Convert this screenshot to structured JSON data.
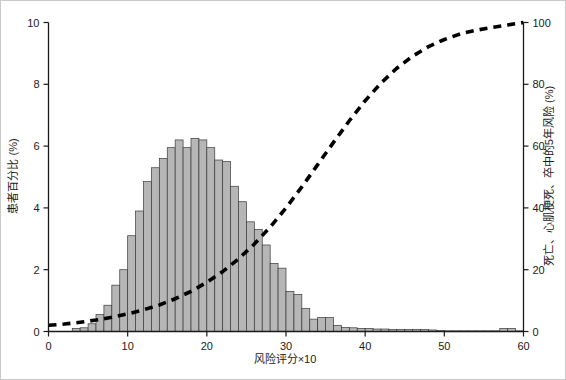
{
  "chart_data": {
    "type": "bar",
    "title": "",
    "subtitle": "",
    "xlabel": "风险评分×10",
    "ylabel": "患者百分比 (%)",
    "y2label": "死亡、心肌梗死、卒中的5年风险 (%)",
    "xlim": [
      0,
      60
    ],
    "ylim": [
      0,
      10
    ],
    "y2lim": [
      0,
      100
    ],
    "grid": false,
    "legend": false,
    "legend_position": "none",
    "xticks": [
      0,
      10,
      20,
      30,
      40,
      50,
      60
    ],
    "xticklabels": [
      "0",
      "10",
      "20",
      "30",
      "40",
      "50",
      "60"
    ],
    "yticks": [
      0,
      2,
      4,
      6,
      8,
      10
    ],
    "yticklabels": [
      "0",
      "2",
      "4",
      "6",
      "8",
      "10"
    ],
    "y2ticks": [
      0,
      20,
      40,
      60,
      80,
      100
    ],
    "y2ticklabels": [
      "0",
      "20",
      "40",
      "60",
      "80",
      "100"
    ],
    "bar_color": "#b6b6b6",
    "bar_edge_color": "#3a3a3a",
    "curve_color": "#000000",
    "curve_style": "dashed",
    "bar_width": 1,
    "series": [
      {
        "name": "患者百分比 (%)",
        "type": "bar",
        "axis": "left",
        "categories": [
          0,
          1,
          2,
          3,
          4,
          5,
          6,
          7,
          8,
          9,
          10,
          11,
          12,
          13,
          14,
          15,
          16,
          17,
          18,
          19,
          20,
          21,
          22,
          23,
          24,
          25,
          26,
          27,
          28,
          29,
          30,
          31,
          32,
          33,
          34,
          35,
          36,
          37,
          38,
          39,
          40,
          41,
          42,
          43,
          44,
          45,
          46,
          47,
          48,
          49,
          50,
          51,
          52,
          53,
          54,
          55,
          56,
          57,
          58,
          59
        ],
        "values": [
          0,
          0,
          0,
          0.1,
          0.12,
          0.25,
          0.55,
          0.85,
          1.5,
          2.0,
          3.1,
          3.9,
          4.85,
          5.3,
          5.6,
          5.95,
          6.2,
          5.95,
          6.25,
          6.2,
          5.95,
          5.55,
          5.5,
          4.7,
          4.2,
          3.55,
          3.3,
          2.8,
          2.2,
          2.05,
          1.3,
          1.2,
          0.75,
          0.4,
          0.45,
          0.45,
          0.2,
          0.13,
          0.12,
          0.1,
          0.1,
          0.08,
          0.08,
          0.07,
          0.07,
          0.07,
          0.07,
          0.06,
          0.05,
          0.03,
          0.02,
          0.02,
          0.02,
          0.02,
          0.02,
          0.02,
          0.02,
          0.1,
          0.1,
          0.02
        ]
      },
      {
        "name": "死亡、心肌梗死、卒中的5年风险 (%)",
        "type": "line",
        "axis": "right",
        "x": [
          0,
          2,
          4,
          6,
          8,
          10,
          12,
          14,
          16,
          18,
          20,
          22,
          24,
          26,
          28,
          30,
          32,
          34,
          36,
          38,
          40,
          42,
          44,
          46,
          48,
          50,
          52,
          54,
          56,
          58,
          60
        ],
        "values": [
          2.0,
          2.4,
          3.0,
          3.7,
          4.6,
          5.7,
          7.0,
          8.6,
          10.6,
          13.0,
          15.9,
          19.4,
          23.5,
          28.3,
          33.8,
          40.0,
          46.8,
          54.0,
          61.2,
          68.2,
          74.7,
          80.4,
          85.2,
          89.1,
          92.2,
          94.5,
          96.3,
          97.5,
          98.4,
          99.2,
          100.0
        ]
      }
    ]
  },
  "axes": {
    "left_title": "患者百分比 (%)",
    "right_title": "死亡、心肌梗死、卒中的5年风险 (%)",
    "bottom_title": "风险评分×10"
  }
}
